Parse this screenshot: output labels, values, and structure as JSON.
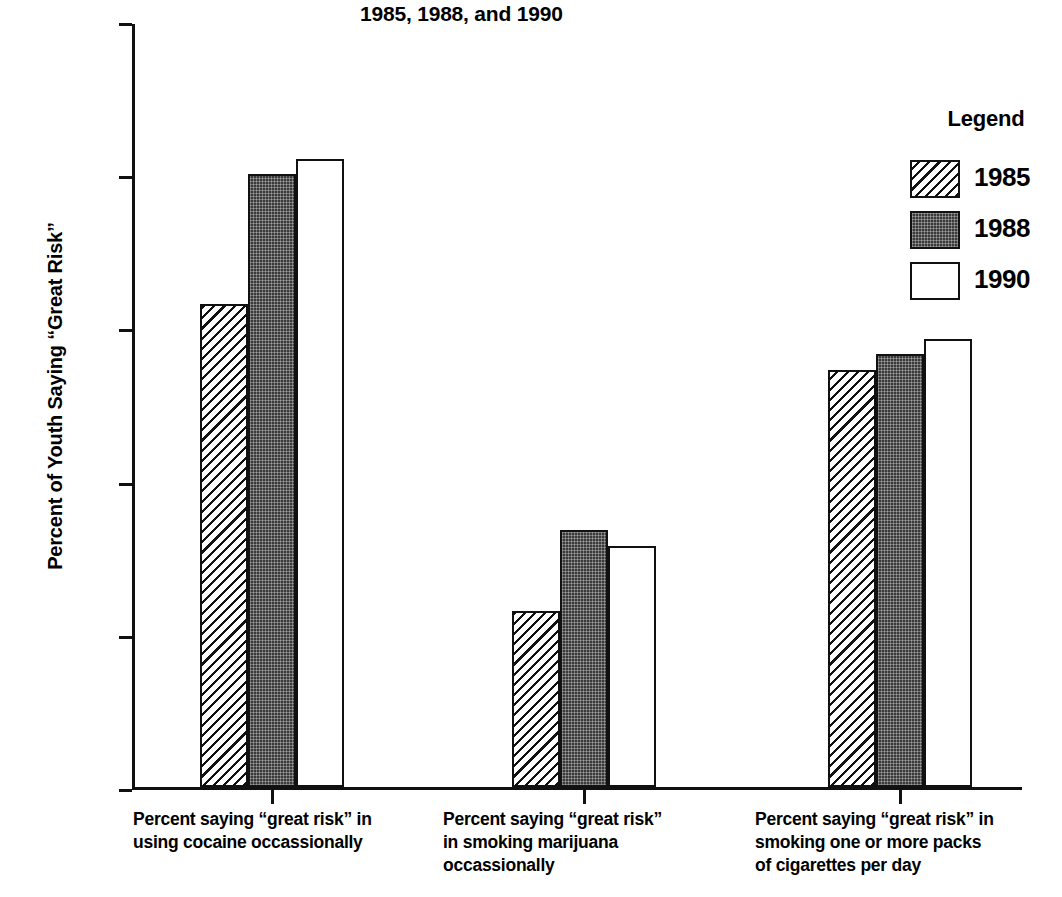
{
  "chart_data": {
    "type": "bar",
    "title": "1985, 1988, and 1990",
    "xlabel": "",
    "ylabel": "Percent of Youth Saying “Great Risk”",
    "ylim": [
      0,
      100
    ],
    "yticks": [
      "0",
      "20",
      "40",
      "60",
      "80",
      "100"
    ],
    "ytick_values": [
      0,
      20,
      40,
      60,
      80,
      100
    ],
    "grid": false,
    "legend_position": "right",
    "legend_title": "Legend",
    "categories": [
      "Percent saying “great risk” in\nusing cocaine occassionally",
      "Percent saying “great risk”\nin smoking marijuana\noccassionally",
      "Percent saying “great risk” in\nsmoking one or more packs\nof cigarettes per day"
    ],
    "series": [
      {
        "name": "1985",
        "fill": "diagonal-hatch",
        "color": "#ffffff",
        "values": [
          63,
          23,
          54.5
        ]
      },
      {
        "name": "1988",
        "fill": "dark-stipple",
        "color": "#3a3a3a",
        "values": [
          80,
          33.5,
          56.5
        ]
      },
      {
        "name": "1990",
        "fill": "white",
        "color": "#ffffff",
        "values": [
          82,
          31.5,
          58.5
        ]
      }
    ]
  },
  "axis": {
    "y_label": "Percent of Youth Saying “Great Risk”",
    "ticks": [
      "100",
      "80",
      "60",
      "40",
      "20",
      "0"
    ]
  },
  "legend": {
    "title": "Legend",
    "items": [
      {
        "label": "1985"
      },
      {
        "label": "1988"
      },
      {
        "label": "1990"
      }
    ]
  },
  "categories": [
    {
      "label": "Percent saying “great risk” in\nusing cocaine occassionally"
    },
    {
      "label": "Percent saying “great risk”\nin smoking marijuana\noccassionally"
    },
    {
      "label": "Percent saying “great risk” in\nsmoking one or more packs\nof cigarettes per day"
    }
  ]
}
